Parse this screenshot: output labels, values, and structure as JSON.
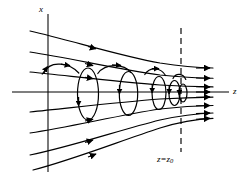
{
  "figure": {
    "type": "physics-field-line-diagram",
    "background_color": "#ffffff",
    "stroke_color": "#000000",
    "labels": {
      "x_axis": "x",
      "z_axis": "z",
      "mirror_plane_prefix": "z",
      "mirror_plane_operator": "=",
      "mirror_plane_value": "z",
      "mirror_plane_subscript": "0"
    },
    "axes": {
      "vertical_axis_x": 48,
      "vertical_axis_top": 14,
      "vertical_axis_bottom": 172,
      "horizontal_axis_y": 92,
      "horizontal_axis_left": 12,
      "horizontal_axis_right": 229
    },
    "mirror_plane": {
      "x": 181,
      "top": 28,
      "bottom": 152,
      "dash_pattern": "6,4"
    },
    "field_lines": [
      {
        "name": "field-line-1",
        "offset": -55,
        "arrow_t": 0.4
      },
      {
        "name": "field-line-2",
        "offset": -36,
        "arrow_t": 0.4
      },
      {
        "name": "field-line-3",
        "offset": -18,
        "arrow_t": 0.4
      },
      {
        "name": "field-line-4",
        "offset": 0,
        "arrow_t": 0.4
      },
      {
        "name": "field-line-5",
        "offset": 18,
        "arrow_t": 0.4
      },
      {
        "name": "field-line-6",
        "offset": 36,
        "arrow_t": 0.4
      },
      {
        "name": "field-line-7",
        "offset": 55,
        "arrow_t": 0.4
      }
    ],
    "helix": {
      "start_x": 44,
      "end_x": 181,
      "loops": 4,
      "loop_centers": [
        88,
        128,
        157,
        172
      ],
      "loop_radii_x": [
        10.5,
        9.0,
        6.5,
        5.0
      ],
      "loop_radii_y": [
        26.0,
        21.5,
        15.0,
        11.5
      ],
      "center_y": 92,
      "rotation_sense": "counterclockwise-viewed-down-z"
    }
  }
}
